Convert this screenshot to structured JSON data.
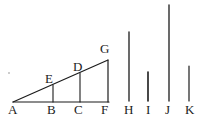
{
  "figure": {
    "stroke_color": "#1b1b1b",
    "background_color": "#ffffff",
    "baseline_y": 102,
    "labels": [
      {
        "id": "A",
        "text": "A",
        "x": 8,
        "y": 103
      },
      {
        "id": "B",
        "text": "B",
        "x": 47,
        "y": 103
      },
      {
        "id": "C",
        "text": "C",
        "x": 74,
        "y": 103
      },
      {
        "id": "F",
        "text": "F",
        "x": 101,
        "y": 103
      },
      {
        "id": "H",
        "text": "H",
        "x": 124,
        "y": 103
      },
      {
        "id": "I",
        "text": "I",
        "x": 145,
        "y": 103
      },
      {
        "id": "J",
        "text": "J",
        "x": 165,
        "y": 103
      },
      {
        "id": "K",
        "text": "K",
        "x": 185,
        "y": 103
      },
      {
        "id": "E",
        "text": "E",
        "x": 45,
        "y": 73
      },
      {
        "id": "D",
        "text": "D",
        "x": 73,
        "y": 61
      },
      {
        "id": "G",
        "text": "G",
        "x": 100,
        "y": 43
      }
    ],
    "baseline": {
      "name": "AF",
      "x1": 13,
      "y1": 102,
      "x2": 109,
      "y2": 102
    },
    "hypotenuse": {
      "name": "AG",
      "x1": 13,
      "y1": 102,
      "x2": 108,
      "y2": 60
    },
    "ordinates": [
      {
        "name": "BE",
        "x": 53,
        "y_top": 85,
        "y_bottom": 102
      },
      {
        "name": "CD",
        "x": 80,
        "y_top": 73,
        "y_bottom": 102
      },
      {
        "name": "FG",
        "x": 108,
        "y_top": 60,
        "y_bottom": 102
      }
    ],
    "bars": [
      {
        "name": "H",
        "x": 129,
        "y_top": 32,
        "y_bottom": 101,
        "length": 69
      },
      {
        "name": "I",
        "x": 148,
        "y_top": 72,
        "y_bottom": 101,
        "length": 29
      },
      {
        "name": "J",
        "x": 169,
        "y_top": 5,
        "y_bottom": 101,
        "length": 96
      },
      {
        "name": "K",
        "x": 189,
        "y_top": 66,
        "y_bottom": 101,
        "length": 35
      }
    ],
    "speck": {
      "x": 8,
      "y": 72
    }
  }
}
